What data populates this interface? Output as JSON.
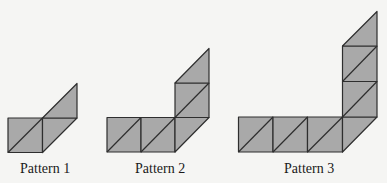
{
  "figure": {
    "fill_color": "#a9a9a9",
    "stroke_color": "#2e2e2e",
    "background_color": "#f5f5f3",
    "cell_size": 34.5
  },
  "patterns": [
    {
      "label": "Pattern 1",
      "full_squares": 1,
      "vertical_squares": 0,
      "label_x": 20
    },
    {
      "label": "Pattern 2",
      "full_squares": 2,
      "vertical_squares": 1,
      "label_x": 135
    },
    {
      "label": "Pattern 3",
      "full_squares": 3,
      "vertical_squares": 2,
      "label_x": 284
    }
  ]
}
